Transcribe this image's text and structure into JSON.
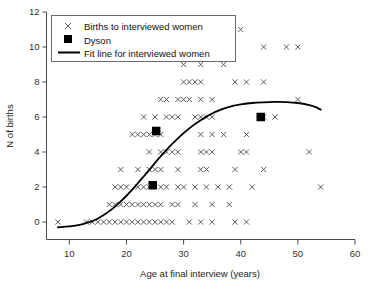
{
  "chart_data": {
    "type": "scatter",
    "title": "",
    "xlabel": "Age at final interview (years)",
    "ylabel": "N of births",
    "xlim": [
      6,
      60
    ],
    "ylim": [
      -1,
      12
    ],
    "xticks": [
      10,
      20,
      30,
      40,
      50,
      60
    ],
    "yticks": [
      0,
      2,
      4,
      6,
      8,
      10,
      12
    ],
    "xtick_labels": [
      "10",
      "20",
      "30",
      "40",
      "50",
      "60"
    ],
    "ytick_labels": [
      "0",
      "2",
      "4",
      "6",
      "8",
      "10",
      "12"
    ],
    "grid": false,
    "legend_position": "top-left",
    "series": [
      {
        "name": "Births to interviewed women",
        "marker": "x",
        "color": "#4b4b4b",
        "points": [
          [
            8,
            0
          ],
          [
            13,
            0
          ],
          [
            14,
            0
          ],
          [
            15,
            0
          ],
          [
            16,
            0
          ],
          [
            17,
            0
          ],
          [
            18,
            0
          ],
          [
            19,
            0
          ],
          [
            20,
            0
          ],
          [
            21,
            0
          ],
          [
            22,
            0
          ],
          [
            23,
            0
          ],
          [
            24,
            0
          ],
          [
            25,
            0
          ],
          [
            26,
            0
          ],
          [
            27,
            0
          ],
          [
            28,
            0
          ],
          [
            31,
            0
          ],
          [
            33,
            0
          ],
          [
            35,
            0
          ],
          [
            39,
            0
          ],
          [
            41,
            0
          ],
          [
            17,
            1
          ],
          [
            18,
            1
          ],
          [
            19,
            1
          ],
          [
            20,
            1
          ],
          [
            21,
            1
          ],
          [
            22,
            1
          ],
          [
            23,
            1
          ],
          [
            24,
            1
          ],
          [
            25,
            1
          ],
          [
            26,
            1
          ],
          [
            28,
            1
          ],
          [
            29,
            1
          ],
          [
            32,
            1
          ],
          [
            35,
            1
          ],
          [
            38,
            1
          ],
          [
            18,
            2
          ],
          [
            19,
            2
          ],
          [
            20,
            2
          ],
          [
            22,
            2
          ],
          [
            23,
            2
          ],
          [
            24,
            2
          ],
          [
            26,
            2
          ],
          [
            27,
            2
          ],
          [
            29,
            2
          ],
          [
            30,
            2
          ],
          [
            32,
            2
          ],
          [
            34,
            2
          ],
          [
            36,
            2
          ],
          [
            38,
            2
          ],
          [
            42,
            2
          ],
          [
            54,
            2
          ],
          [
            19,
            3
          ],
          [
            22,
            3
          ],
          [
            24,
            3
          ],
          [
            25,
            3
          ],
          [
            26,
            3
          ],
          [
            29,
            3
          ],
          [
            33,
            3
          ],
          [
            34,
            3
          ],
          [
            39,
            3
          ],
          [
            44,
            3
          ],
          [
            24,
            4
          ],
          [
            26,
            4
          ],
          [
            27,
            4
          ],
          [
            28,
            4
          ],
          [
            29,
            4
          ],
          [
            33,
            4
          ],
          [
            34,
            4
          ],
          [
            35,
            4
          ],
          [
            40,
            4
          ],
          [
            41,
            4
          ],
          [
            52,
            4
          ],
          [
            21,
            5
          ],
          [
            22,
            5
          ],
          [
            23,
            5
          ],
          [
            24,
            5
          ],
          [
            25,
            5
          ],
          [
            26,
            5
          ],
          [
            33,
            5
          ],
          [
            35,
            5
          ],
          [
            37,
            5
          ],
          [
            41,
            5
          ],
          [
            23,
            6
          ],
          [
            25,
            6
          ],
          [
            27,
            6
          ],
          [
            28,
            6
          ],
          [
            29,
            6
          ],
          [
            32,
            6
          ],
          [
            33,
            6
          ],
          [
            34,
            6
          ],
          [
            35,
            6
          ],
          [
            44,
            6
          ],
          [
            46,
            6
          ],
          [
            26,
            7
          ],
          [
            27,
            7
          ],
          [
            29,
            7
          ],
          [
            30,
            7
          ],
          [
            31,
            7
          ],
          [
            33,
            7
          ],
          [
            35,
            7
          ],
          [
            50,
            7
          ],
          [
            30,
            8
          ],
          [
            31,
            8
          ],
          [
            32,
            8
          ],
          [
            33,
            8
          ],
          [
            39,
            8
          ],
          [
            41,
            8
          ],
          [
            44,
            8
          ],
          [
            30,
            9
          ],
          [
            33,
            9
          ],
          [
            37,
            9
          ],
          [
            31,
            10
          ],
          [
            32,
            10
          ],
          [
            33,
            10
          ],
          [
            34,
            10
          ],
          [
            44,
            10
          ],
          [
            48,
            10
          ],
          [
            50,
            10
          ],
          [
            40,
            11
          ]
        ]
      },
      {
        "name": "Dyson",
        "marker": "square",
        "color": "#000000",
        "points": [
          [
            24.6,
            2.1
          ],
          [
            25.2,
            5.2
          ],
          [
            43.5,
            6.0
          ]
        ]
      }
    ],
    "fit_line": {
      "name": "Fit line for interviewed women",
      "color": "#000000",
      "points": [
        [
          8,
          -0.3
        ],
        [
          10,
          -0.25
        ],
        [
          12,
          -0.15
        ],
        [
          13,
          -0.05
        ],
        [
          14,
          0.05
        ],
        [
          15,
          0.2
        ],
        [
          16,
          0.4
        ],
        [
          17,
          0.62
        ],
        [
          18,
          0.88
        ],
        [
          19,
          1.18
        ],
        [
          20,
          1.5
        ],
        [
          21,
          1.85
        ],
        [
          22,
          2.22
        ],
        [
          23,
          2.6
        ],
        [
          24,
          2.98
        ],
        [
          25,
          3.38
        ],
        [
          26,
          3.76
        ],
        [
          27,
          4.12
        ],
        [
          28,
          4.46
        ],
        [
          29,
          4.78
        ],
        [
          30,
          5.08
        ],
        [
          31,
          5.35
        ],
        [
          32,
          5.6
        ],
        [
          33,
          5.82
        ],
        [
          34,
          6.02
        ],
        [
          35,
          6.2
        ],
        [
          36,
          6.35
        ],
        [
          37,
          6.48
        ],
        [
          38,
          6.58
        ],
        [
          39,
          6.66
        ],
        [
          40,
          6.72
        ],
        [
          42,
          6.8
        ],
        [
          44,
          6.84
        ],
        [
          46,
          6.86
        ],
        [
          48,
          6.85
        ],
        [
          50,
          6.8
        ],
        [
          52,
          6.68
        ],
        [
          53,
          6.58
        ],
        [
          54,
          6.42
        ]
      ]
    }
  },
  "legend": {
    "items": [
      {
        "label": "Births to interviewed women",
        "symbol": "x-marker"
      },
      {
        "label": "Dyson",
        "symbol": "filled-square-marker"
      },
      {
        "label": "Fit line for interviewed women",
        "symbol": "line-marker"
      }
    ]
  },
  "axes": {
    "x_title": "Age at final interview (years)",
    "y_title": "N of births"
  }
}
